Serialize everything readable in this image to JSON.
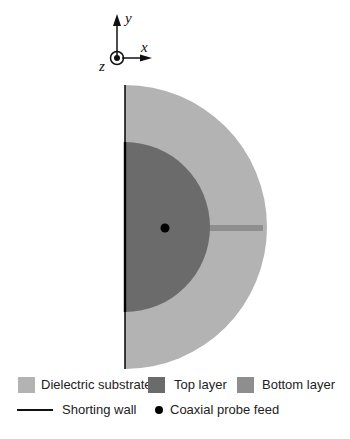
{
  "axes": {
    "x_label": "x",
    "y_label": "y",
    "z_label": "z"
  },
  "diagram": {
    "colors": {
      "dielectric_substrate": "#b3b3b3",
      "top_layer": "#6b6b6b",
      "bottom_layer": "#8e8e8e",
      "shorting_wall": "#111111",
      "probe_feed": "#000000"
    }
  },
  "legend": {
    "items": [
      {
        "label": "Dielectric substrate",
        "type": "swatch",
        "color": "#b3b3b3"
      },
      {
        "label": "Top layer",
        "type": "swatch",
        "color": "#6b6b6b"
      },
      {
        "label": "Bottom layer",
        "type": "swatch",
        "color": "#8e8e8e"
      },
      {
        "label": "Shorting wall",
        "type": "line",
        "color": "#111111"
      },
      {
        "label": "Coaxial probe feed",
        "type": "dot",
        "color": "#000000"
      }
    ]
  }
}
